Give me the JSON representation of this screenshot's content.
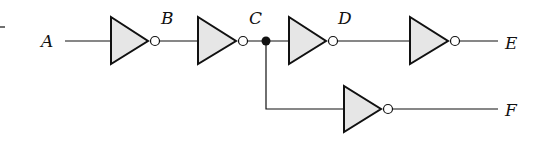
{
  "diagram": {
    "type": "logic-circuit",
    "nodes": [
      {
        "id": "A",
        "label": "A"
      },
      {
        "id": "B",
        "label": "B"
      },
      {
        "id": "C",
        "label": "C"
      },
      {
        "id": "D",
        "label": "D"
      },
      {
        "id": "E",
        "label": "E"
      },
      {
        "id": "F",
        "label": "F"
      }
    ],
    "gates": [
      {
        "id": "inv1",
        "type": "NOT",
        "input": "A",
        "output": "B"
      },
      {
        "id": "inv2",
        "type": "NOT",
        "input": "B",
        "output": "C"
      },
      {
        "id": "inv3",
        "type": "NOT",
        "input": "C",
        "output": "D"
      },
      {
        "id": "inv4",
        "type": "NOT",
        "input": "D",
        "output": "E"
      },
      {
        "id": "inv5",
        "type": "NOT",
        "input": "C",
        "output": "F"
      }
    ],
    "colors": {
      "gate_fill": "#e6e6e6",
      "stroke": "#111111"
    }
  }
}
